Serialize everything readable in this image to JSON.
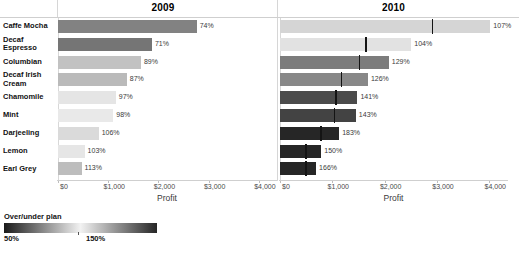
{
  "panels": [
    {
      "title": "2009"
    },
    {
      "title": "2010"
    }
  ],
  "rows": [
    "Caffe Mocha",
    "Decaf Espresso",
    "Columbian",
    "Decaf Irish Cream",
    "Chamomile",
    "Mint",
    "Darjeeling",
    "Lemon",
    "Earl Grey"
  ],
  "axis": {
    "title": "Profit",
    "ticks": [
      "$0",
      "$1,000",
      "$2,000",
      "$3,000",
      "$4,000"
    ],
    "tick_values": [
      0,
      1000,
      2000,
      3000,
      4000
    ],
    "min": 0,
    "max": 4300
  },
  "legend": {
    "title": "Over/under plan",
    "min_label": "50%",
    "max_label": "150%",
    "colors": {
      "low": "#1a1a1a",
      "mid": "#f2f2f2",
      "high": "#262626"
    }
  },
  "chart_data": {
    "type": "bar",
    "xlabel": "Profit",
    "ylabel": "",
    "xlim": [
      0,
      4300
    ],
    "grid": false,
    "legend_position": "bottom-left",
    "categories": [
      "Caffe Mocha",
      "Decaf Espresso",
      "Columbian",
      "Decaf Irish Cream",
      "Chamomile",
      "Mint",
      "Darjeeling",
      "Lemon",
      "Earl Grey"
    ],
    "panels": [
      {
        "name": "2009",
        "value_labels": [
          "74%",
          "71%",
          "89%",
          "87%",
          "97%",
          "98%",
          "106%",
          "103%",
          "113%"
        ],
        "ratio_values": [
          74,
          71,
          89,
          87,
          97,
          98,
          106,
          103,
          113
        ],
        "values": [
          2760,
          1870,
          1650,
          1370,
          1150,
          1100,
          810,
          530,
          470
        ],
        "reference_values": []
      },
      {
        "name": "2010",
        "value_labels": [
          "107%",
          "104%",
          "129%",
          "126%",
          "141%",
          "143%",
          "183%",
          "150%",
          "166%"
        ],
        "ratio_values": [
          107,
          104,
          129,
          126,
          141,
          143,
          183,
          150,
          166
        ],
        "values": [
          4020,
          2510,
          2080,
          1680,
          1480,
          1450,
          1130,
          790,
          690
        ],
        "reference_values": [
          2900,
          1630,
          1510,
          1160,
          1060,
          1030,
          770,
          480,
          480
        ]
      }
    ]
  }
}
